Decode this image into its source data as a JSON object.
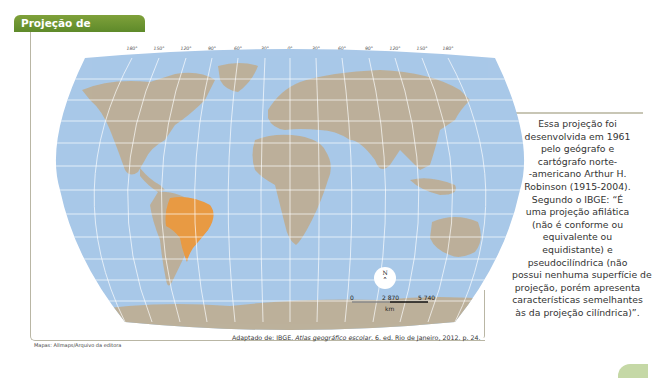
{
  "title": "Projeção de Robinson",
  "map": {
    "projection": "Robinson",
    "longitude_labels": [
      "180°",
      "150°",
      "120°",
      "90°",
      "60°",
      "30°",
      "0°",
      "30°",
      "60°",
      "90°",
      "120°",
      "150°",
      "180°"
    ],
    "highlighted_country": "Brasil",
    "colors": {
      "ocean": "#a9c8e8",
      "land": "#bcb19b",
      "highlight": "#e89a45",
      "graticule": "#ffffff",
      "title_bg": "#6b922f",
      "frame": "#b9b6a4"
    },
    "compass": {
      "north_label": "N"
    },
    "scale": {
      "labels": [
        "0",
        "2 870",
        "5 740"
      ],
      "unit": "km"
    }
  },
  "description_lines": [
    "Essa projeção foi",
    "desenvolvida em 1961",
    "pelo geógrafo e",
    "cartógrafo norte-",
    "-americano Arthur H.",
    "Robinson (1915-2004).",
    "Segundo o IBGE: “É",
    "uma projeção afilática",
    "(não é conforme ou",
    "equivalente ou",
    "equidistante) e",
    "pseudocilíndrica (não",
    "possui nenhuma superfície de",
    "projeção, porém apresenta",
    "características semelhantes",
    "às da projeção cilíndrica)”."
  ],
  "credit": "Mapas: Allmaps/Arquivo da editora",
  "source": {
    "prefix": "Adaptado de: IBGE. ",
    "title": "Atlas geográfico escolar",
    "suffix": ". 6. ed. Rio de Janeiro, 2012. p. 24."
  }
}
